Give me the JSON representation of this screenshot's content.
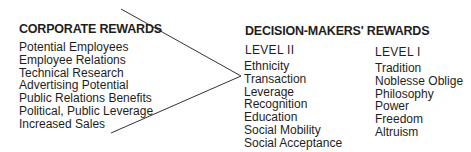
{
  "corporate": {
    "title": "CORPORATE REWARDS",
    "items": [
      "Potential Employees",
      "Employee Relations",
      "Technical Research",
      "Advertising Potential",
      "Public Relations Benefits",
      "Political, Public Leverage",
      "Increased Sales"
    ]
  },
  "decision_makers": {
    "title": "DECISION-MAKERS' REWARDS",
    "level2": {
      "label": "LEVEL II",
      "items": [
        "Ethnicity",
        "Transaction",
        "Leverage",
        "Recognition",
        "Education",
        "Social Mobility",
        "Social Acceptance"
      ]
    },
    "level1": {
      "label": "LEVEL I",
      "items": [
        "Tradition",
        "Noblesse Oblige",
        "Philosophy",
        "Power",
        "Freedom",
        "Altruism"
      ]
    }
  },
  "colors": {
    "text": "#1e1e1e",
    "line": "#333333"
  }
}
